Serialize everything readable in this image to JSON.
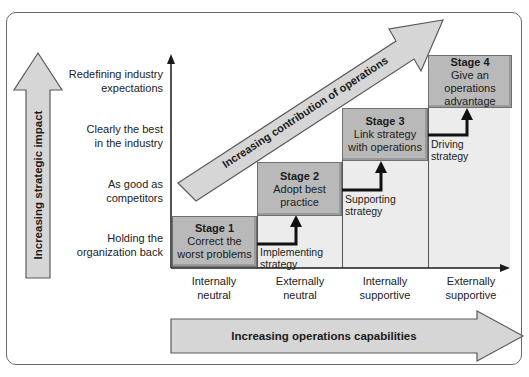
{
  "diagram": {
    "vertical_arrow": {
      "label": "Increasing strategic impact",
      "icon": "up-arrow-icon"
    },
    "horizontal_arrow": {
      "label": "Increasing operations capabilities",
      "icon": "right-arrow-icon"
    },
    "diagonal_arrow": {
      "label": "Increasing contribution of operations",
      "icon": "diagonal-arrow-icon"
    },
    "y_levels": [
      {
        "line1": "Redefining industry",
        "line2": "expectations"
      },
      {
        "line1": "Clearly the best",
        "line2": "in the industry"
      },
      {
        "line1": "As good as",
        "line2": "competitors"
      },
      {
        "line1": "Holding the",
        "line2": "organization back"
      }
    ],
    "x_levels": [
      {
        "line1": "Internally",
        "line2": "neutral"
      },
      {
        "line1": "Externally",
        "line2": "neutral"
      },
      {
        "line1": "Internally",
        "line2": "supportive"
      },
      {
        "line1": "Externally",
        "line2": "supportive"
      }
    ],
    "stages": [
      {
        "title": "Stage 1",
        "line1": "Correct the",
        "line2": "worst problems",
        "line3": ""
      },
      {
        "title": "Stage 2",
        "line1": "Adopt best",
        "line2": "practice",
        "line3": ""
      },
      {
        "title": "Stage 3",
        "line1": "Link strategy",
        "line2": "with operations",
        "line3": ""
      },
      {
        "title": "Stage 4",
        "line1": "Give an",
        "line2": "operations",
        "line3": "advantage"
      }
    ],
    "transitions": [
      {
        "line1": "Implementing",
        "line2": "strategy"
      },
      {
        "line1": "Supporting",
        "line2": "strategy"
      },
      {
        "line1": "Driving",
        "line2": "strategy"
      }
    ],
    "colors": {
      "stage_fill": "#b9b9b9",
      "arrow_fill": "#d6d6d6",
      "band_fill": "#ececec",
      "line": "#1a1a1a"
    }
  }
}
